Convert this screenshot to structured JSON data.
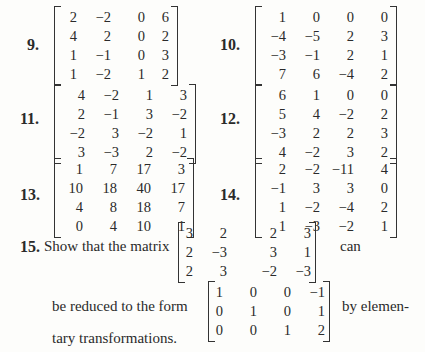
{
  "problems": [
    {
      "number": "9.",
      "matrix": [
        [
          "2",
          "−2",
          "0",
          "6"
        ],
        [
          "4",
          "2",
          "0",
          "2"
        ],
        [
          "1",
          "−1",
          "0",
          "3"
        ],
        [
          "1",
          "−2",
          "1",
          "2"
        ]
      ]
    },
    {
      "number": "10.",
      "matrix": [
        [
          "1",
          "0",
          "0",
          "0"
        ],
        [
          "−4",
          "−5",
          "2",
          "3"
        ],
        [
          "−3",
          "−1",
          "2",
          "1"
        ],
        [
          "7",
          "6",
          "−4",
          "2"
        ]
      ]
    },
    {
      "number": "11.",
      "matrix": [
        [
          "4",
          "−2",
          "1",
          "3"
        ],
        [
          "2",
          "−1",
          "3",
          "−2"
        ],
        [
          "−2",
          "3",
          "−2",
          "1"
        ],
        [
          "3",
          "−3",
          "2",
          "−2"
        ]
      ]
    },
    {
      "number": "12.",
      "matrix": [
        [
          "6",
          "1",
          "0",
          "0"
        ],
        [
          "5",
          "4",
          "−2",
          "2"
        ],
        [
          "−3",
          "2",
          "2",
          "3"
        ],
        [
          "4",
          "−2",
          "3",
          "2"
        ]
      ]
    },
    {
      "number": "13.",
      "matrix": [
        [
          "1",
          "7",
          "17",
          "3"
        ],
        [
          "10",
          "18",
          "40",
          "17"
        ],
        [
          "4",
          "8",
          "18",
          "7"
        ],
        [
          "0",
          "4",
          "10",
          "1"
        ]
      ]
    },
    {
      "number": "14.",
      "matrix": [
        [
          "2",
          "−2",
          "−11",
          "4"
        ],
        [
          "−1",
          "3",
          "3",
          "0"
        ],
        [
          "1",
          "−2",
          "−4",
          "2"
        ],
        [
          "1",
          "−3",
          "−2",
          "1"
        ]
      ]
    }
  ],
  "problem15": {
    "number": "15.",
    "text_before": "Show that the matrix",
    "text_after": "can",
    "matrix": [
      [
        "3",
        "2",
        "2",
        "3"
      ],
      [
        "2",
        "−3",
        "3",
        "1"
      ],
      [
        "2",
        "3",
        "−2",
        "−3"
      ]
    ],
    "line2_before": "be reduced to the form",
    "line2_after": "by elemen-",
    "target_matrix": [
      [
        "1",
        "0",
        "0",
        "−1"
      ],
      [
        "0",
        "1",
        "0",
        "1"
      ],
      [
        "0",
        "0",
        "1",
        "2"
      ]
    ],
    "line3": "tary transformations."
  }
}
